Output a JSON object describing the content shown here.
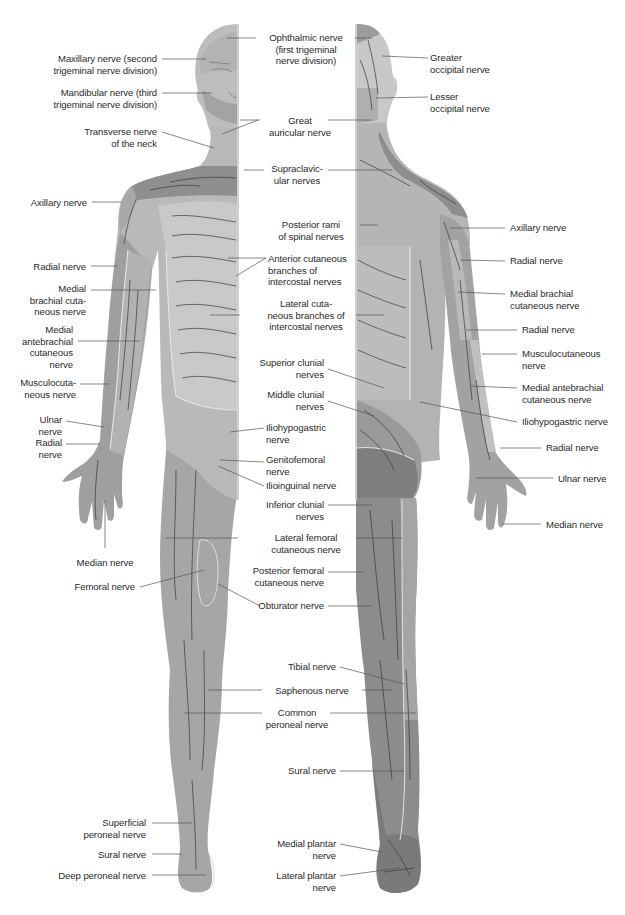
{
  "figure": {
    "views": [
      "anterior",
      "posterior"
    ],
    "colors": {
      "background": "#ffffff",
      "skin_light": "#c4c4c4",
      "skin_mid": "#a9a9a9",
      "skin_dark": "#8a8a8a",
      "territory_border": "#e6e6e6",
      "nerve_branch": "#3a3a3a",
      "leader_line": "#555555",
      "label_text": "#2b2b2b"
    }
  },
  "labels": {
    "left_column": [
      {
        "id": "maxillary",
        "text": "Maxillary nerve (second\ntrigeminal nerve division)",
        "x": 157,
        "y": 53
      },
      {
        "id": "mandibular",
        "text": "Mandibular nerve (third\ntrigeminal nerve division)",
        "x": 157,
        "y": 87
      },
      {
        "id": "transverse-neck",
        "text": "Transverse nerve\nof the neck",
        "x": 157,
        "y": 126
      },
      {
        "id": "axillary-ant",
        "text": "Axillary nerve",
        "x": 87,
        "y": 197
      },
      {
        "id": "radial-ant-1",
        "text": "Radial nerve",
        "x": 86,
        "y": 261
      },
      {
        "id": "medial-brachial-ant",
        "text": "Medial\nbrachial cuta-\nneous nerve",
        "x": 86,
        "y": 283
      },
      {
        "id": "medial-antebrachial-ant",
        "text": "Medial\nantebrachial\ncutaneous\nnerve",
        "x": 73,
        "y": 324
      },
      {
        "id": "musculocutaneous-ant",
        "text": "Musculocuta-\nneous nerve",
        "x": 76,
        "y": 377
      },
      {
        "id": "ulnar-ant",
        "text": "Ulnar\nnerve",
        "x": 62,
        "y": 414
      },
      {
        "id": "radial-ant-2",
        "text": "Radial\nnerve",
        "x": 62,
        "y": 437
      },
      {
        "id": "median-ant",
        "text": "Median nerve",
        "x": 105,
        "y": 557,
        "align": "center"
      },
      {
        "id": "femoral",
        "text": "Femoral nerve",
        "x": 135,
        "y": 581
      },
      {
        "id": "superficial-peroneal",
        "text": "Superficial\nperoneal nerve",
        "x": 146,
        "y": 817
      },
      {
        "id": "sural-ant",
        "text": "Sural nerve",
        "x": 146,
        "y": 849
      },
      {
        "id": "deep-peroneal",
        "text": "Deep peroneal nerve",
        "x": 146,
        "y": 870
      }
    ],
    "center_column": [
      {
        "id": "ophthalmic",
        "text": "Ophthalmic nerve\n(first trigeminal\nnerve division)",
        "x": 306,
        "y": 32
      },
      {
        "id": "great-auricular",
        "text": "Great\nauricular nerve",
        "x": 300,
        "y": 115
      },
      {
        "id": "supraclavicular",
        "text": "Supraclavic-\nular nerves",
        "x": 300,
        "y": 163
      },
      {
        "id": "posterior-rami",
        "text": "Posterior rami\nof spinal nerves",
        "x": 310,
        "y": 219
      },
      {
        "id": "anterior-cutaneous-branches",
        "text": "Anterior cutaneous\nbranches of\nintercostal nerves",
        "x": 268,
        "y": 253,
        "align": "left"
      },
      {
        "id": "lateral-cutaneous-branches",
        "text": "Lateral cuta-\nneous branches of\nintercostal nerves",
        "x": 298,
        "y": 309
      },
      {
        "id": "superior-clunial",
        "text": "Superior clunial\nnerves",
        "x": 324,
        "y": 363,
        "align": "right"
      },
      {
        "id": "middle-clunial",
        "text": "Middle clunial\nnerves",
        "x": 324,
        "y": 395,
        "align": "right"
      },
      {
        "id": "iliohypogastric-ant",
        "text": "Iliohypogastric\nnerve",
        "x": 267,
        "y": 424,
        "align": "left"
      },
      {
        "id": "genitofemoral",
        "text": "Genitofemoral\nnerve",
        "x": 267,
        "y": 458,
        "align": "left"
      },
      {
        "id": "ilioinguinal",
        "text": "Ilioinguinal nerve",
        "x": 267,
        "y": 481,
        "align": "left"
      },
      {
        "id": "inferior-clunial",
        "text": "Inferior clunial\nnerves",
        "x": 324,
        "y": 499,
        "align": "right"
      },
      {
        "id": "lateral-femoral-cutaneous",
        "text": "Lateral femoral\ncutaneous nerve",
        "x": 300,
        "y": 532
      },
      {
        "id": "posterior-femoral-cutaneous",
        "text": "Posterior femoral\ncutaneous nerve",
        "x": 324,
        "y": 566,
        "align": "right"
      },
      {
        "id": "obturator",
        "text": "Obturator nerve",
        "x": 324,
        "y": 600,
        "align": "right"
      },
      {
        "id": "tibial",
        "text": "Tibial nerve",
        "x": 336,
        "y": 661,
        "align": "right"
      },
      {
        "id": "saphenous",
        "text": "Saphenous nerve",
        "x": 297,
        "y": 685
      },
      {
        "id": "common-peroneal",
        "text": "Common\nperoneal nerve",
        "x": 297,
        "y": 707
      },
      {
        "id": "sural-post",
        "text": "Sural nerve",
        "x": 336,
        "y": 765,
        "align": "right"
      },
      {
        "id": "medial-plantar",
        "text": "Medial plantar\nnerve",
        "x": 336,
        "y": 838,
        "align": "right"
      },
      {
        "id": "lateral-plantar",
        "text": "Lateral plantar\nnerve",
        "x": 336,
        "y": 870,
        "align": "right"
      }
    ],
    "right_column": [
      {
        "id": "greater-occipital",
        "text": "Greater\noccipital nerve",
        "x": 430,
        "y": 52
      },
      {
        "id": "lesser-occipital",
        "text": "Lesser\noccipital nerve",
        "x": 430,
        "y": 91
      },
      {
        "id": "axillary-post",
        "text": "Axillary nerve",
        "x": 510,
        "y": 222
      },
      {
        "id": "radial-post-1",
        "text": "Radial nerve",
        "x": 510,
        "y": 255
      },
      {
        "id": "medial-brachial-post",
        "text": "Medial brachial\ncutaneous nerve",
        "x": 510,
        "y": 288
      },
      {
        "id": "radial-post-2",
        "text": "Radial nerve",
        "x": 522,
        "y": 324
      },
      {
        "id": "musculocutaneous-post",
        "text": "Musculocutaneous\nnerve",
        "x": 522,
        "y": 348
      },
      {
        "id": "medial-antebrachial-post",
        "text": "Medial antebrachial\ncutaneous nerve",
        "x": 522,
        "y": 382
      },
      {
        "id": "iliohypogastric-post",
        "text": "Iliohypogastric nerve",
        "x": 522,
        "y": 416
      },
      {
        "id": "radial-post-3",
        "text": "Radial nerve",
        "x": 546,
        "y": 442
      },
      {
        "id": "ulnar-post",
        "text": "Ulnar nerve",
        "x": 558,
        "y": 473
      },
      {
        "id": "median-post",
        "text": "Median nerve",
        "x": 546,
        "y": 519
      }
    ]
  }
}
